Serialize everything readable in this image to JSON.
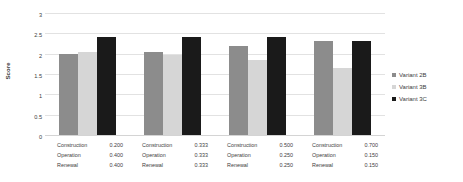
{
  "chart_data": {
    "type": "bar",
    "title": "",
    "xlabel": "",
    "ylabel": "Score",
    "ylim": [
      0,
      3
    ],
    "ytick_labels": [
      "3",
      "2.5",
      "2",
      "1.5",
      "1",
      "0.5",
      "0"
    ],
    "ytick_values": [
      3,
      2.5,
      2,
      1.5,
      1,
      0.5,
      0
    ],
    "grid": true,
    "legend_position": "right",
    "categories": [
      "Group 1",
      "Group 2",
      "Group 3",
      "Group 4"
    ],
    "series": [
      {
        "name": "Variant 2B",
        "color": "#8c8c8c",
        "values": [
          2.0,
          2.05,
          2.2,
          2.3
        ]
      },
      {
        "name": "Variant 3B",
        "color": "#d6d6d6",
        "values": [
          2.05,
          1.97,
          1.85,
          1.65
        ]
      },
      {
        "name": "Variant 3C",
        "color": "#1a1a1a",
        "values": [
          2.4,
          2.42,
          2.4,
          2.32
        ]
      }
    ],
    "weight_table": {
      "row_labels": [
        "Construction",
        "Operation",
        "Renewal"
      ],
      "groups": [
        {
          "values": [
            "0.200",
            "0.400",
            "0.400"
          ]
        },
        {
          "values": [
            "0.333",
            "0.333",
            "0.333"
          ]
        },
        {
          "values": [
            "0.500",
            "0.250",
            "0.250"
          ]
        },
        {
          "values": [
            "0.700",
            "0.150",
            "0.150"
          ]
        }
      ]
    }
  },
  "legend": {
    "items": [
      {
        "label": "Variant 2B",
        "color": "#8c8c8c"
      },
      {
        "label": "Variant 3B",
        "color": "#d6d6d6"
      },
      {
        "label": "Variant 3C",
        "color": "#1a1a1a"
      }
    ]
  },
  "axis": {
    "y_title": "Score"
  }
}
